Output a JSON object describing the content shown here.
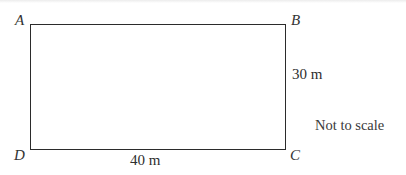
{
  "diagram": {
    "shape": "rectangle",
    "vertices": {
      "top_left": "A",
      "top_right": "B",
      "bottom_right": "C",
      "bottom_left": "D"
    },
    "dimensions": {
      "height_label": "30 m",
      "width_label": "40 m"
    },
    "note": "Not to scale",
    "colors": {
      "line": "#2b2b2b",
      "background": "#ffffff"
    }
  }
}
